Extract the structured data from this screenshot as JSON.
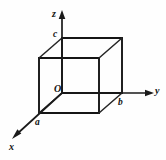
{
  "figure": {
    "kind": "3d-axes-cube-diagram",
    "background_color": "#fefefe",
    "line_color": "#151515",
    "label_color": "#111111"
  },
  "axes": [
    {
      "id": "z",
      "label": "z",
      "direction": "up",
      "origin_px": [
        62,
        93
      ],
      "tip_px": [
        62,
        12
      ],
      "has_arrow": true,
      "label_px": [
        52,
        9
      ]
    },
    {
      "id": "y",
      "label": "y",
      "direction": "right",
      "origin_px": [
        62,
        93
      ],
      "tip_px": [
        152,
        93
      ],
      "has_arrow": true,
      "label_px": [
        155,
        86
      ]
    },
    {
      "id": "x",
      "label": "x",
      "direction": "down-left",
      "origin_px": [
        62,
        93
      ],
      "tip_px": [
        12,
        139
      ],
      "has_arrow": true,
      "label_px": [
        9,
        142
      ]
    }
  ],
  "points": [
    {
      "id": "origin",
      "label": "O",
      "px": [
        62,
        93
      ],
      "label_px": [
        54,
        84
      ]
    },
    {
      "id": "c",
      "label": "c",
      "axis": "z",
      "px": [
        62,
        38
      ],
      "label_px": [
        53,
        30
      ]
    },
    {
      "id": "b",
      "label": "b",
      "axis": "y",
      "px": [
        122,
        93
      ],
      "label_px": [
        118,
        98
      ]
    },
    {
      "id": "a",
      "label": "a",
      "axis": "x",
      "px": [
        39,
        113
      ],
      "label_px": [
        35,
        118
      ]
    }
  ],
  "cube": {
    "name": "unit-cell-cube",
    "back_face_px": [
      [
        62,
        38
      ],
      [
        122,
        38
      ],
      [
        122,
        93
      ],
      [
        62,
        93
      ]
    ],
    "front_face_px": [
      [
        39,
        58
      ],
      [
        99,
        58
      ],
      [
        99,
        113
      ],
      [
        39,
        113
      ]
    ],
    "depth_offset_px": [
      -23,
      20
    ],
    "edge_count": 12
  }
}
